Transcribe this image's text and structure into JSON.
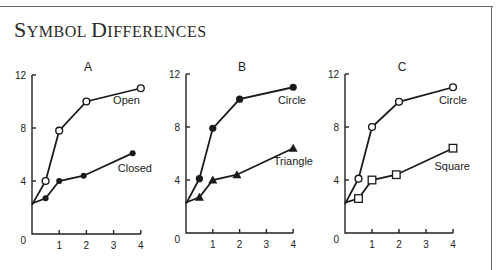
{
  "title": {
    "prefix_big": "S",
    "prefix_small": "YMBOL ",
    "mid_big": "D",
    "mid_small": "IFFERENCES",
    "full": "Symbol Differences"
  },
  "colors": {
    "ink": "#1a1a1a",
    "frame": "#6a6a6a",
    "background": "#ffffff"
  },
  "chart_data": [
    {
      "type": "line",
      "title": "A",
      "xlabel": "",
      "ylabel": "",
      "xlim": [
        0,
        4
      ],
      "ylim": [
        0,
        12
      ],
      "x_ticks": [
        1,
        2,
        3,
        4
      ],
      "y_ticks": [
        0,
        4,
        8,
        12
      ],
      "grid": false,
      "series": [
        {
          "name": "Open",
          "marker": "open-circle",
          "x": [
            0,
            0.5,
            1,
            2,
            4
          ],
          "y": [
            2.2,
            4.0,
            7.8,
            10.0,
            11.0
          ]
        },
        {
          "name": "Closed",
          "marker": "filled-circle",
          "x": [
            0,
            0.5,
            1,
            1.9,
            3.7
          ],
          "y": [
            2.3,
            2.7,
            4.0,
            4.4,
            6.1
          ]
        }
      ]
    },
    {
      "type": "line",
      "title": "B",
      "xlabel": "",
      "ylabel": "",
      "xlim": [
        0,
        4
      ],
      "ylim": [
        0,
        12
      ],
      "x_ticks": [
        1,
        2,
        3,
        4
      ],
      "y_ticks": [
        0,
        4,
        8,
        12
      ],
      "grid": false,
      "series": [
        {
          "name": "Circle",
          "marker": "filled-circle",
          "x": [
            0,
            0.5,
            1,
            2,
            4
          ],
          "y": [
            2.2,
            4.1,
            7.9,
            10.1,
            11.0
          ]
        },
        {
          "name": "Triangle",
          "marker": "filled-triangle",
          "x": [
            0,
            0.5,
            1,
            1.9,
            4
          ],
          "y": [
            2.3,
            2.7,
            4.0,
            4.4,
            6.4
          ]
        }
      ]
    },
    {
      "type": "line",
      "title": "C",
      "xlabel": "",
      "ylabel": "",
      "xlim": [
        0,
        4
      ],
      "ylim": [
        0,
        12
      ],
      "x_ticks": [
        1,
        2,
        3,
        4
      ],
      "y_ticks": [
        0,
        4,
        8,
        12
      ],
      "grid": false,
      "series": [
        {
          "name": "Circle",
          "marker": "open-circle",
          "x": [
            0,
            0.5,
            1,
            2,
            4
          ],
          "y": [
            2.2,
            4.1,
            8.0,
            9.9,
            11.0
          ]
        },
        {
          "name": "Square",
          "marker": "open-square",
          "x": [
            0,
            0.5,
            1,
            1.9,
            4
          ],
          "y": [
            2.3,
            2.6,
            4.0,
            4.4,
            6.4
          ]
        }
      ]
    }
  ],
  "layout": {
    "panels": [
      {
        "x0": 32,
        "y0": 234,
        "xs": 27.2,
        "ys": 13.25,
        "title_x": 88,
        "title_y": 71,
        "labels": [
          {
            "x": 140,
            "y": 104,
            "anchor": "end"
          },
          {
            "x": 152,
            "y": 172,
            "anchor": "end"
          }
        ]
      },
      {
        "x0": 186,
        "y0": 233,
        "xs": 26.8,
        "ys": 13.25,
        "title_x": 242,
        "title_y": 71,
        "labels": [
          {
            "x": 306,
            "y": 104,
            "anchor": "end"
          },
          {
            "x": 313,
            "y": 165,
            "anchor": "end"
          }
        ]
      },
      {
        "x0": 345,
        "y0": 233,
        "xs": 27.0,
        "ys": 13.25,
        "title_x": 402,
        "title_y": 71,
        "labels": [
          {
            "x": 467,
            "y": 104,
            "anchor": "end"
          },
          {
            "x": 470,
            "y": 170,
            "anchor": "end"
          }
        ]
      }
    ]
  }
}
